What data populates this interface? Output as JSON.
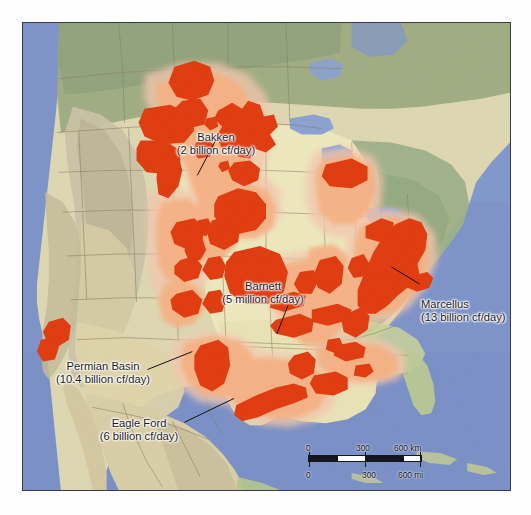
{
  "map": {
    "title": "North American shale gas and tight oil plays",
    "colors": {
      "ocean": "#7e93c8",
      "ocean_deep": "#6d83bb",
      "great_lakes": "#8fa4d2",
      "plains": "#ece7bc",
      "forest": "#9aa97f",
      "forest_dark": "#8b9c72",
      "mountain": "#cdc5a6",
      "desert": "#ddd3ad",
      "arid": "#d6cba4",
      "play_core": "#e03c10",
      "play_halo": "#f5b183",
      "play_outer": "#f2c6ad",
      "border_line": "#8d7f63",
      "frame": "#3a3a4e"
    },
    "labels": [
      {
        "id": "bakken",
        "name": "Bakken",
        "rate": "(2 billion cf/day)",
        "x": 183,
        "y": 108,
        "align": "center",
        "leader": {
          "x1": 219,
          "y1": 136,
          "x2": 198,
          "y2": 176
        }
      },
      {
        "id": "marcellus",
        "name": "Marcellus",
        "rate": "(13 billion cf/day)",
        "x": 420,
        "y": 281,
        "align": "left",
        "leader": {
          "x1": 421,
          "y1": 285,
          "x2": 393,
          "y2": 268
        }
      },
      {
        "id": "barnett",
        "name": "Barnett",
        "rate": "(5 million cf/day)",
        "x": 238,
        "y": 283,
        "align": "center",
        "leader": {
          "x1": 289,
          "y1": 307,
          "x2": 278,
          "y2": 335
        }
      },
      {
        "id": "permian-basin",
        "name": "Permian Basin",
        "rate": "(10.4 billion cf/day)",
        "x": 54,
        "y": 364,
        "align": "center",
        "leader": {
          "x1": 148,
          "y1": 371,
          "x2": 193,
          "y2": 353
        }
      },
      {
        "id": "eagle-ford",
        "name": "Eagle Ford",
        "rate": "(6 billion cf/day)",
        "x": 100,
        "y": 421,
        "align": "center",
        "leader": {
          "x1": 185,
          "y1": 424,
          "x2": 235,
          "y2": 400
        }
      }
    ],
    "scalebar": {
      "km": {
        "zero": "0",
        "mid": "300",
        "max": "600 km"
      },
      "mi": {
        "zero": "0",
        "mid": "300",
        "max": "600 mi"
      }
    }
  }
}
